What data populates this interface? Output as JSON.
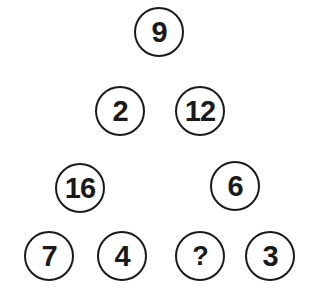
{
  "puzzle": {
    "nodes": [
      {
        "id": "top",
        "value": "9",
        "cx": 159,
        "cy": 32
      },
      {
        "id": "mid-left",
        "value": "2",
        "cx": 120,
        "cy": 111
      },
      {
        "id": "mid-right",
        "value": "12",
        "cx": 200,
        "cy": 111
      },
      {
        "id": "left-parent",
        "value": "16",
        "cx": 80,
        "cy": 188
      },
      {
        "id": "right-parent",
        "value": "6",
        "cx": 235,
        "cy": 186
      },
      {
        "id": "bottom-1",
        "value": "7",
        "cx": 49,
        "cy": 256
      },
      {
        "id": "bottom-2",
        "value": "4",
        "cx": 122,
        "cy": 256
      },
      {
        "id": "bottom-3",
        "value": "?",
        "cx": 200,
        "cy": 256
      },
      {
        "id": "bottom-4",
        "value": "3",
        "cx": 270,
        "cy": 256
      }
    ],
    "colors": {
      "stroke": "#1a1a1a",
      "text": "#1a1a1a",
      "background": "#ffffff"
    }
  }
}
